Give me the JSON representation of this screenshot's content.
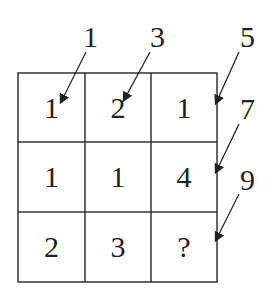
{
  "grid": {
    "rows": [
      [
        "1",
        "2",
        "1"
      ],
      [
        "1",
        "1",
        "4"
      ],
      [
        "2",
        "3",
        "?"
      ]
    ]
  },
  "pointer_labels": [
    "1",
    "3",
    "5",
    "7",
    "9"
  ],
  "colors": {
    "line": "#333333",
    "text": "#222222",
    "background": "#ffffff"
  }
}
